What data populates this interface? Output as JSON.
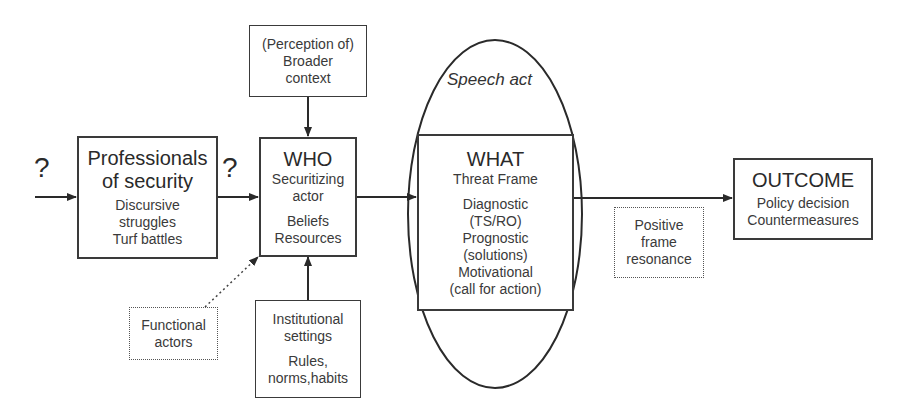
{
  "diagram": {
    "question_marks": [
      "?",
      "?"
    ],
    "professionals_box": {
      "title_lines": [
        "Professionals",
        "of security"
      ],
      "detail_lines": [
        "Discursive",
        "struggles",
        "Turf battles"
      ]
    },
    "context_box": {
      "lines": [
        "(Perception of)",
        "Broader",
        "context"
      ]
    },
    "who_box": {
      "title": "WHO",
      "subtitle_lines": [
        "Securitizing",
        "actor"
      ],
      "detail_lines": [
        "Beliefs",
        "Resources"
      ]
    },
    "functional_box": {
      "lines": [
        "Functional",
        "actors"
      ]
    },
    "institutional_box": {
      "title_lines": [
        "Institutional",
        "settings"
      ],
      "detail_lines": [
        "Rules,",
        "norms,habits"
      ]
    },
    "speech_act": {
      "label": "Speech act"
    },
    "what_box": {
      "title": "WHAT",
      "subtitle": "Threat Frame",
      "detail_lines": [
        "Diagnostic",
        "(TS/RO)",
        "Prognostic",
        "(solutions)",
        "Motivational",
        "(call for action)"
      ]
    },
    "resonance_box": {
      "lines": [
        "Positive",
        "frame",
        "resonance"
      ]
    },
    "outcome_box": {
      "title": "OUTCOME",
      "detail_lines": [
        "Policy decision",
        "Countermeasures"
      ]
    }
  }
}
